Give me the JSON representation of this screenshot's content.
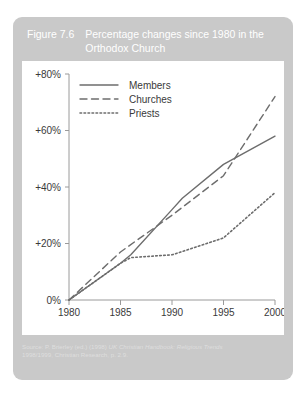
{
  "figure": {
    "number": "Figure 7.6",
    "title": "Percentage changes since 1980 in the Orthodox Church",
    "source_line1_prefix": "Source: P. Brierley (ed.) (1998) ",
    "source_line1_italic": "UK Christian Handbook: Religious Trends",
    "source_line2": "1998/1999, Christian Research, p. 2.9.",
    "header_bg": "#c9c9c9",
    "panel_bg": "#ffffff",
    "line_color": "#6d6d6d",
    "text_color": "#3a3a3a"
  },
  "chart_data": {
    "type": "line",
    "title": "Percentage changes since 1980 in the Orthodox Church",
    "xlabel": "",
    "ylabel": "",
    "x": [
      1980,
      1985,
      1990,
      1995,
      2000
    ],
    "xlim": [
      1980,
      2000
    ],
    "ylim": [
      0,
      80
    ],
    "xtick_labels": [
      "1980",
      "1985",
      "1990",
      "1995",
      "2000"
    ],
    "ytick_values": [
      0,
      20,
      40,
      60,
      80
    ],
    "ytick_labels": [
      "0%",
      "+20%",
      "+40%",
      "+60%",
      "+80%"
    ],
    "grid": false,
    "legend_position": "top-left-inside",
    "series": [
      {
        "name": "Members",
        "style": "solid",
        "x": [
          1980,
          1985,
          1986,
          1990,
          1991,
          1995,
          2000
        ],
        "values": [
          0,
          13,
          16,
          32,
          36,
          48,
          58
        ]
      },
      {
        "name": "Churches",
        "style": "dashed",
        "x": [
          1980,
          1985,
          1990,
          1995,
          2000
        ],
        "values": [
          0,
          17,
          30,
          44,
          72
        ]
      },
      {
        "name": "Priests",
        "style": "dotted",
        "x": [
          1980,
          1985,
          1986,
          1990,
          1995,
          2000
        ],
        "values": [
          0,
          13,
          15,
          16,
          22,
          38
        ]
      }
    ]
  },
  "legend": {
    "items": [
      {
        "label": "Members",
        "style": "solid"
      },
      {
        "label": "Churches",
        "style": "dashed"
      },
      {
        "label": "Priests",
        "style": "dotted"
      }
    ]
  }
}
